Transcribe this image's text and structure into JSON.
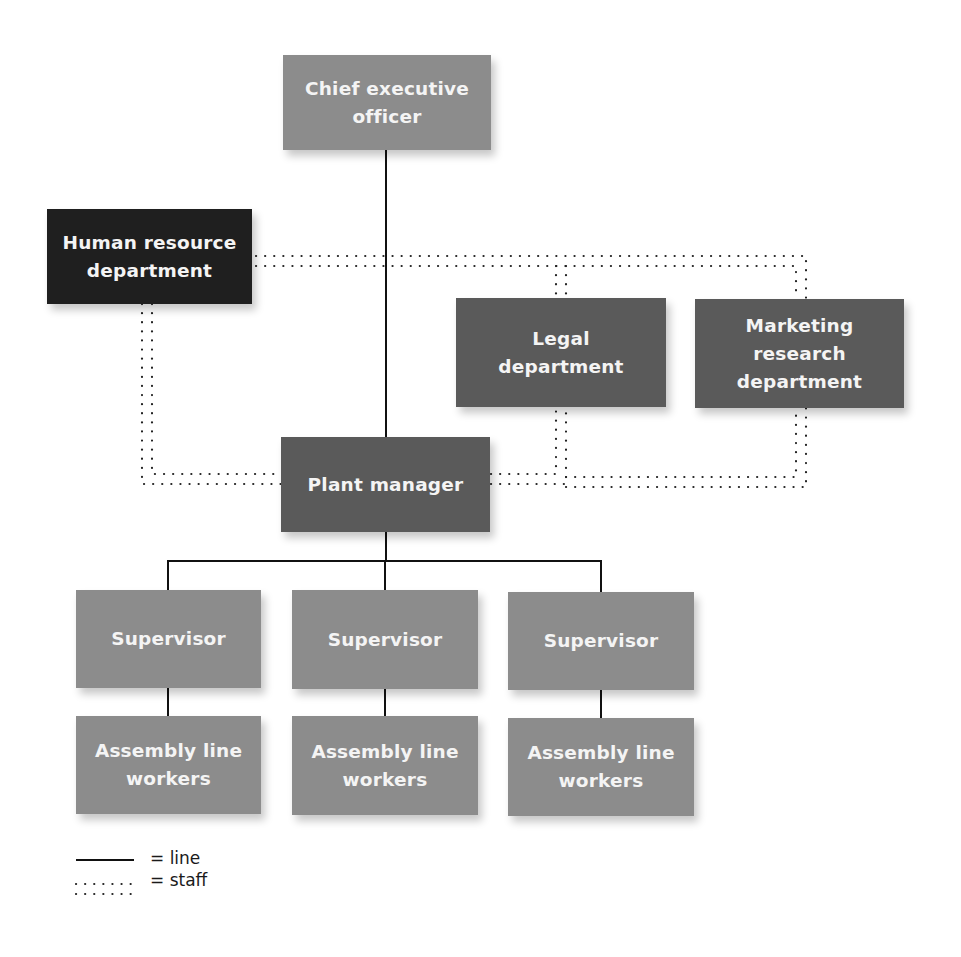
{
  "diagram": {
    "type": "organization-chart",
    "colors": {
      "light_box": "#8c8c8c",
      "mid_box": "#5a5a5a",
      "dark_box": "#1f1f1f",
      "box_text": "#f4f4f4",
      "line": "#111111"
    },
    "nodes": {
      "ceo": {
        "label": "Chief executive\nofficer"
      },
      "hr": {
        "label": "Human resource\ndepartment"
      },
      "legal": {
        "label": "Legal\ndepartment"
      },
      "marketing": {
        "label": "Marketing\nresearch\ndepartment"
      },
      "plant_manager": {
        "label": "Plant manager"
      },
      "supervisors": [
        {
          "label": "Supervisor"
        },
        {
          "label": "Supervisor"
        },
        {
          "label": "Supervisor"
        }
      ],
      "workers": [
        {
          "label": "Assembly line\nworkers"
        },
        {
          "label": "Assembly line\nworkers"
        },
        {
          "label": "Assembly line\nworkers"
        }
      ]
    },
    "legend": {
      "line": "= line",
      "staff": "= staff"
    }
  }
}
